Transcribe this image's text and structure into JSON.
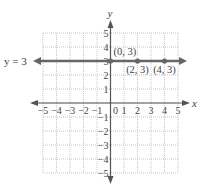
{
  "chart_data": {
    "type": "line",
    "title": "",
    "xlabel": "x",
    "ylabel": "y",
    "xlim": [
      -5,
      5
    ],
    "ylim": [
      -5,
      5
    ],
    "grid": true,
    "x_ticks": [
      -5,
      -4,
      -3,
      -2,
      -1,
      0,
      1,
      2,
      3,
      4,
      5
    ],
    "y_ticks": [
      -5,
      -4,
      -3,
      -2,
      -1,
      1,
      2,
      3,
      4,
      5
    ],
    "x_tick_labels": [
      "−5",
      "−4",
      "−3",
      "−2",
      "−1",
      "0",
      "1",
      "2",
      "3",
      "4",
      "5"
    ],
    "y_tick_labels": [
      "−5",
      "−4",
      "−3",
      "−2",
      "−1",
      "1",
      "2",
      "3",
      "4",
      "5"
    ],
    "series": [
      {
        "name": "y = 3",
        "equation": "y = 3",
        "kind": "horizontal-line",
        "y": 3,
        "color": "#666666",
        "points": [
          {
            "x": 0,
            "y": 3,
            "label": "(0, 3)"
          },
          {
            "x": 2,
            "y": 3,
            "label": "(2, 3)"
          },
          {
            "x": 4,
            "y": 3,
            "label": "(4, 3)"
          }
        ]
      }
    ],
    "annotations": [
      {
        "text": "y = 3",
        "position": "left of line"
      }
    ]
  },
  "labels": {
    "x_axis": "x",
    "y_axis": "y",
    "equation": "y = 3",
    "zero": "0"
  },
  "colors": {
    "line": "#666666",
    "axis": "#555555",
    "grid": "#b8b8b8",
    "text": "#444444"
  }
}
